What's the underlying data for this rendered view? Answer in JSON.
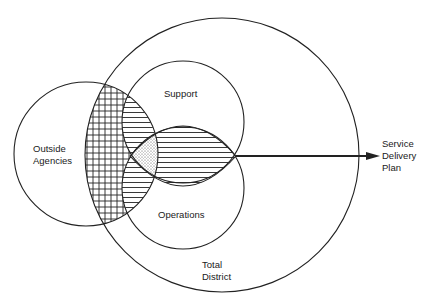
{
  "diagram": {
    "type": "venn",
    "sets": [
      {
        "id": "total-district",
        "label_lines": [
          "Total",
          "District"
        ]
      },
      {
        "id": "outside-agencies",
        "label_lines": [
          "Outside",
          "Agencies"
        ]
      },
      {
        "id": "support",
        "label_lines": [
          "Support"
        ]
      },
      {
        "id": "operations",
        "label_lines": [
          "Operations"
        ]
      }
    ],
    "output": {
      "label_lines": [
        "Service",
        "Delivery",
        "Plan"
      ]
    },
    "regions": [
      {
        "name": "outside-agencies-and-total-district",
        "fill": "crosshatch"
      },
      {
        "name": "support-operations-overlap-lens",
        "fill": "horizontal-hatch"
      },
      {
        "name": "all-sets-overlap",
        "fill": "stipple"
      }
    ],
    "colors": {
      "stroke": "#222222",
      "background": "#ffffff"
    }
  },
  "labels": {
    "support": "Support",
    "operations": "Operations",
    "outside_1": "Outside",
    "outside_2": "Agencies",
    "total_1": "Total",
    "total_2": "District",
    "service_1": "Service",
    "service_2": "Delivery",
    "service_3": "Plan"
  }
}
